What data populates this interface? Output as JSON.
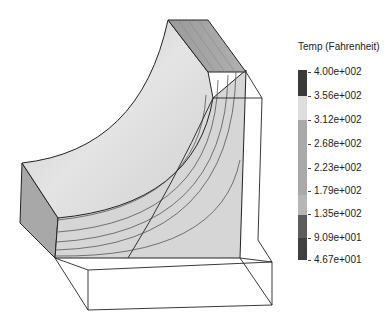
{
  "legend": {
    "title": "Temp (Fahrenheit)",
    "labels": [
      "4.00e+002",
      "3.56e+002",
      "3.12e+002",
      "2.68e+002",
      "2.23e+002",
      "1.79e+002",
      "1.35e+002",
      "9.09e+001",
      "4.67e+001"
    ],
    "segments": [
      {
        "from": 0,
        "to": 26,
        "color": "#3a3a3a"
      },
      {
        "from": 26,
        "to": 50,
        "color": "#dedede"
      },
      {
        "from": 50,
        "to": 125,
        "color": "#a9a9a9"
      },
      {
        "from": 125,
        "to": 145,
        "color": "#b6b6b6"
      },
      {
        "from": 145,
        "to": 168,
        "color": "#5c5c5c"
      },
      {
        "from": 168,
        "to": 190,
        "color": "#404040"
      }
    ]
  },
  "model": {
    "surface_color": "#d8d8d8",
    "edge_color": "#222222",
    "contour_color": "#555555"
  }
}
